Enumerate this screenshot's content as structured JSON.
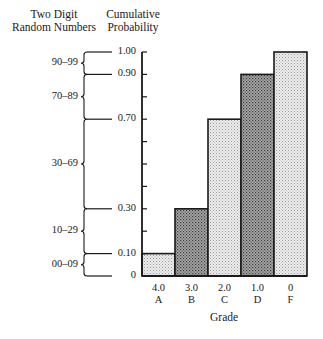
{
  "chart_data": {
    "type": "bar",
    "title": "",
    "xlabel": "Grade",
    "ylabel": "Cumulative Probability",
    "left_header": "Two Digit Random Numbers",
    "categories": [
      "A",
      "B",
      "C",
      "D",
      "F"
    ],
    "grade_points": [
      "4.0",
      "3.0",
      "2.0",
      "1.0",
      "0"
    ],
    "values": [
      0.1,
      0.3,
      0.7,
      0.9,
      1.0
    ],
    "ylim": [
      0,
      1.0
    ],
    "y_tick_labels": [
      "0",
      "0.10",
      "0.30",
      "0.70",
      "0.90",
      "1.00"
    ],
    "y_minor_ticks_step": 0.1,
    "random_number_ranges": [
      {
        "range": "00–09",
        "from": 0.0,
        "to": 0.1
      },
      {
        "range": "10–29",
        "from": 0.1,
        "to": 0.3
      },
      {
        "range": "30–69",
        "from": 0.3,
        "to": 0.7
      },
      {
        "range": "70–89",
        "from": 0.7,
        "to": 0.9
      },
      {
        "range": "90–99",
        "from": 0.9,
        "to": 1.0
      }
    ],
    "bar_shades": [
      "light",
      "dark",
      "light",
      "dark",
      "light"
    ],
    "grid": false,
    "legend": "none"
  },
  "headers": {
    "left_line1": "Two Digit",
    "left_line2": "Random Numbers",
    "right_line1": "Cumulative",
    "right_line2": "Probability"
  },
  "colors": {
    "light_fill": "#d9d9d9",
    "dark_fill": "#8f8f8f",
    "stroke": "#1a1a1a"
  }
}
